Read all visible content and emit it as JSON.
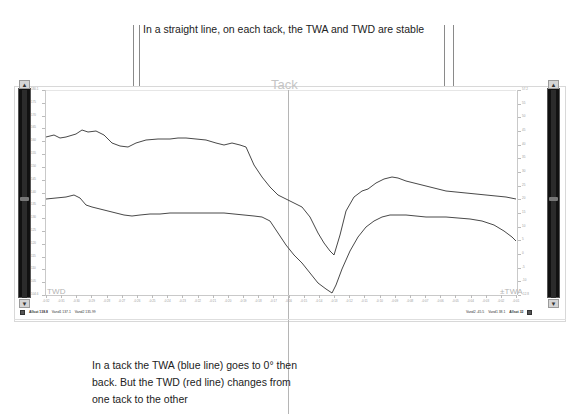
{
  "annotations": {
    "top": "In a straight line, on each tack, the TWA and TWD are stable",
    "bottom": "In a tack the TWA (blue line) goes to 0° then back. But the TWD (red line) changes from one tack to the other"
  },
  "chart_caption": "Tack",
  "series_labels": {
    "twd": "TWD",
    "twa": "±TWA"
  },
  "status": {
    "left": [
      {
        "icon": "grid-icon"
      },
      {
        "text": "Allsot 138.8",
        "bold": true
      },
      {
        "text": "Vand1 137.1"
      },
      {
        "text": "Vand2 135.99"
      }
    ],
    "right": [
      {
        "text": "Vand2 -45.5"
      },
      {
        "text": "Vand1 38.1"
      },
      {
        "text": "Allsot 32",
        "bold": true
      },
      {
        "icon": "grid-icon"
      }
    ]
  },
  "scroll": {
    "left_thumb_pct": 52,
    "right_thumb_pct": 52
  },
  "colors": {
    "twd_line": "#333333",
    "twa_line": "#333333",
    "cursor_line": "#b5b5b5",
    "caption": "#c5c5c5",
    "axis": "#c9c9c9"
  },
  "chart_data": {
    "type": "line",
    "title": "Tack",
    "xlabel": "",
    "ylabel": "",
    "grid": false,
    "legend_position": "inline",
    "y_axis_left": {
      "label": "TWD",
      "ticks": [
        "180.1",
        "175",
        "170",
        "165",
        "160",
        "155",
        "150",
        "145",
        "140",
        "135",
        "130",
        "125",
        "120",
        "115",
        "110",
        "105",
        "104.6"
      ]
    },
    "y_axis_right": {
      "label": "±TWA",
      "ticks": [
        "57.2",
        "55",
        "50",
        "45",
        "40",
        "35",
        "30",
        "25",
        "20",
        "15",
        "10",
        "5",
        "0",
        "-5",
        "-10",
        "-12.8"
      ]
    },
    "x_ticks": [
      "-0:32",
      "-0:31",
      "-0:30",
      "-0:29",
      "-0:28",
      "-0:27",
      "-0:26",
      "-0:25",
      "-0:24",
      "-0:23",
      "-0:22",
      "-0:21",
      "-0:20",
      "-0:19",
      "-0:18",
      "-0:17",
      "-0:16",
      "-0:15",
      "-0:14",
      "-0:13",
      "-0:12",
      "-0:11",
      "-0:10",
      "-0:09",
      "-0:08",
      "-0:07",
      "-0:06",
      "-0:05",
      "-0:04",
      "-0:03",
      "-0:02",
      "-0:01"
    ],
    "series": [
      {
        "name": "TWD",
        "color": "#333333",
        "points": [
          [
            0,
            158
          ],
          [
            8,
            160
          ],
          [
            14,
            157
          ],
          [
            20,
            158
          ],
          [
            30,
            161
          ],
          [
            36,
            165
          ],
          [
            42,
            163
          ],
          [
            50,
            164
          ],
          [
            58,
            160
          ],
          [
            66,
            152
          ],
          [
            74,
            149
          ],
          [
            82,
            148
          ],
          [
            90,
            152
          ],
          [
            100,
            155
          ],
          [
            112,
            156
          ],
          [
            124,
            156
          ],
          [
            132,
            157
          ],
          [
            140,
            157
          ],
          [
            150,
            156
          ],
          [
            160,
            155
          ],
          [
            170,
            152
          ],
          [
            178,
            150
          ],
          [
            186,
            152
          ],
          [
            194,
            150
          ],
          [
            200,
            148
          ],
          [
            208,
            130
          ],
          [
            216,
            118
          ],
          [
            224,
            108
          ],
          [
            232,
            100
          ],
          [
            240,
            96
          ],
          [
            248,
            92
          ],
          [
            256,
            88
          ],
          [
            264,
            78
          ],
          [
            272,
            62
          ],
          [
            278,
            52
          ],
          [
            284,
            44
          ],
          [
            288,
            40
          ],
          [
            294,
            60
          ],
          [
            300,
            84
          ],
          [
            308,
            98
          ],
          [
            316,
            104
          ],
          [
            322,
            106
          ],
          [
            330,
            112
          ],
          [
            338,
            116
          ],
          [
            346,
            118
          ],
          [
            352,
            117
          ],
          [
            360,
            114
          ],
          [
            368,
            112
          ],
          [
            376,
            110
          ],
          [
            384,
            108
          ],
          [
            392,
            106
          ],
          [
            400,
            104
          ],
          [
            410,
            103
          ],
          [
            420,
            102
          ],
          [
            430,
            101
          ],
          [
            440,
            100
          ],
          [
            450,
            99
          ],
          [
            460,
            98
          ],
          [
            470,
            96
          ]
        ]
      },
      {
        "name": "TWA",
        "color": "#333333",
        "points": [
          [
            0,
            96
          ],
          [
            10,
            97
          ],
          [
            20,
            98
          ],
          [
            28,
            100
          ],
          [
            34,
            97
          ],
          [
            40,
            90
          ],
          [
            46,
            88
          ],
          [
            54,
            86
          ],
          [
            62,
            84
          ],
          [
            70,
            82
          ],
          [
            78,
            80
          ],
          [
            86,
            79
          ],
          [
            94,
            80
          ],
          [
            104,
            81
          ],
          [
            114,
            81
          ],
          [
            124,
            82
          ],
          [
            134,
            82
          ],
          [
            146,
            82
          ],
          [
            158,
            82
          ],
          [
            168,
            82
          ],
          [
            178,
            82
          ],
          [
            188,
            81
          ],
          [
            198,
            80
          ],
          [
            208,
            79
          ],
          [
            216,
            78
          ],
          [
            224,
            74
          ],
          [
            232,
            62
          ],
          [
            240,
            50
          ],
          [
            248,
            40
          ],
          [
            256,
            32
          ],
          [
            264,
            22
          ],
          [
            272,
            12
          ],
          [
            280,
            6
          ],
          [
            286,
            2
          ],
          [
            290,
            10
          ],
          [
            296,
            26
          ],
          [
            304,
            44
          ],
          [
            312,
            58
          ],
          [
            320,
            68
          ],
          [
            328,
            74
          ],
          [
            336,
            78
          ],
          [
            344,
            80
          ],
          [
            352,
            80
          ],
          [
            360,
            80
          ],
          [
            370,
            79
          ],
          [
            380,
            78
          ],
          [
            390,
            78
          ],
          [
            400,
            78
          ],
          [
            412,
            77
          ],
          [
            424,
            76
          ],
          [
            436,
            74
          ],
          [
            448,
            70
          ],
          [
            458,
            64
          ],
          [
            466,
            58
          ],
          [
            470,
            54
          ]
        ]
      }
    ]
  }
}
